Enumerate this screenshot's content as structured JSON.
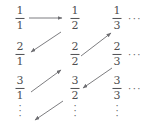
{
  "figure": {
    "width": 153,
    "height": 127,
    "ink_color": "#4f4f52",
    "arrow_color": "#6e6e72",
    "background": "#ffffff"
  },
  "grid": {
    "row_labels": [
      "1",
      "2",
      "3"
    ],
    "column_labels": [
      "1",
      "2",
      "3"
    ],
    "cells": [
      [
        {
          "numerator": "1",
          "denominator": "1",
          "x": 20,
          "y": 18
        },
        {
          "numerator": "1",
          "denominator": "2",
          "x": 75,
          "y": 18
        },
        {
          "numerator": "1",
          "denominator": "3",
          "x": 117,
          "y": 18
        }
      ],
      [
        {
          "numerator": "2",
          "denominator": "1",
          "x": 20,
          "y": 54
        },
        {
          "numerator": "2",
          "denominator": "2",
          "x": 75,
          "y": 54
        },
        {
          "numerator": "2",
          "denominator": "3",
          "x": 117,
          "y": 54
        }
      ],
      [
        {
          "numerator": "3",
          "denominator": "1",
          "x": 20,
          "y": 88
        },
        {
          "numerator": "3",
          "denominator": "2",
          "x": 75,
          "y": 88
        },
        {
          "numerator": "3",
          "denominator": "3",
          "x": 117,
          "y": 88
        }
      ]
    ]
  },
  "ellipses": {
    "horizontal_symbol": "···",
    "vertical_symbol": "·",
    "horizontal": [
      {
        "x": 128,
        "y": 18
      },
      {
        "x": 128,
        "y": 54
      },
      {
        "x": 128,
        "y": 88
      }
    ],
    "vertical": [
      {
        "x": 20,
        "y": 103
      },
      {
        "x": 75,
        "y": 103
      },
      {
        "x": 117,
        "y": 103
      }
    ]
  },
  "arrows": [
    {
      "name": "arrow-right-1-1-to-1-2",
      "direction": "right",
      "x1": 29,
      "y1": 18,
      "x2": 62,
      "y2": 18
    },
    {
      "name": "arrow-diag-1-2-to-2-1",
      "direction": "down-left",
      "x1": 61,
      "y1": 32,
      "x2": 31,
      "y2": 52
    },
    {
      "name": "arrow-diag-3-1-to-2-2",
      "direction": "up-right",
      "x1": 31,
      "y1": 92,
      "x2": 61,
      "y2": 70
    },
    {
      "name": "arrow-diag-2-2-to-1-3",
      "direction": "up-right",
      "x1": 81,
      "y1": 56,
      "x2": 111,
      "y2": 33
    },
    {
      "name": "arrow-diag-2-3-to-3-2",
      "direction": "down-left",
      "x1": 112,
      "y1": 68,
      "x2": 83,
      "y2": 88
    },
    {
      "name": "arrow-diag-3-2-to-4-1",
      "direction": "down-left",
      "x1": 63,
      "y1": 101,
      "x2": 35,
      "y2": 120
    }
  ],
  "chart_data": {
    "type": "diagram",
    "sequence": [
      "1/1",
      "1/2",
      "2/1",
      "3/1",
      "2/2",
      "1/3"
    ],
    "rows": 3,
    "columns": 3
  }
}
